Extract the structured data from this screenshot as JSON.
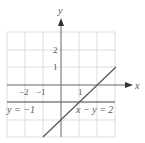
{
  "diagram": {
    "type": "coordinate-graph",
    "axes": {
      "x_label": "x",
      "y_label": "y",
      "x_ticks": [
        {
          "value": -2,
          "label": "−2"
        },
        {
          "value": -1,
          "label": "−1"
        },
        {
          "value": 1,
          "label": "1"
        }
      ],
      "y_ticks": [
        {
          "value": 2,
          "label": "2"
        },
        {
          "value": 1,
          "label": "1"
        }
      ]
    },
    "grid": {
      "xmin": -3,
      "xmax": 3,
      "ymin": -3,
      "ymax": 3,
      "step": 1
    },
    "lines": [
      {
        "label": "y = −1",
        "equation": "y = -1",
        "color": "#444444"
      },
      {
        "label": "x − y = 2",
        "equation": "x - y = 2",
        "from": [
          -1,
          -3
        ],
        "to": [
          3,
          1
        ],
        "color": "#555555"
      }
    ],
    "colors": {
      "grid": "#dddddd",
      "axis": "#666666",
      "text": "#555555"
    }
  }
}
